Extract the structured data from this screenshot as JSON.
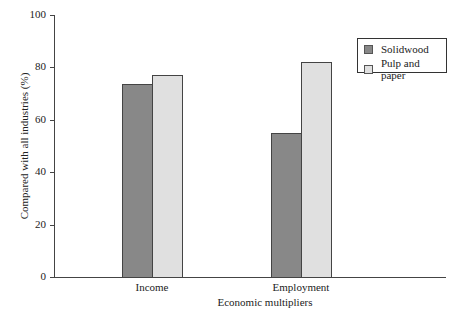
{
  "chart_data": {
    "type": "bar",
    "title": "",
    "xlabel": "Economic multipliers",
    "ylabel": "Compared with all industries (%)",
    "categories": [
      "Income",
      "Employment"
    ],
    "series": [
      {
        "name": "Solidwood",
        "values": [
          73.5,
          55
        ],
        "color": "#888888"
      },
      {
        "name": "Pulp and paper",
        "values": [
          77,
          82
        ],
        "color": "#e0e0e0"
      }
    ],
    "ylim": [
      0,
      100
    ],
    "yticks": [
      "0",
      "20",
      "40",
      "60",
      "80",
      "100"
    ],
    "grid": false,
    "legend_position": "upper right"
  }
}
